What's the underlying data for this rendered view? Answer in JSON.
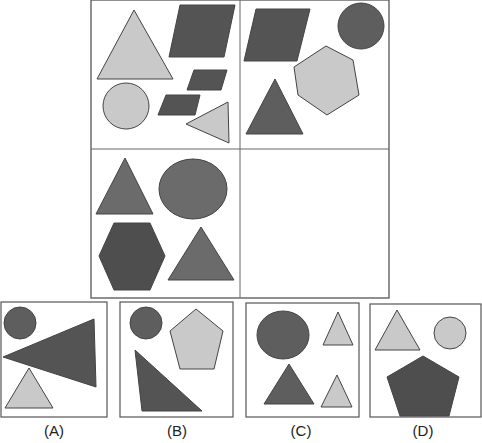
{
  "puzzle": {
    "colors": {
      "dark": "#545454",
      "medium": "#6b6b6b",
      "light": "#c9c9c9",
      "stroke": "#444444",
      "border": "#555555"
    },
    "grid": {
      "cells": [
        {
          "position": "top-left",
          "shapes": [
            "light-triangle",
            "dark-parallelogram",
            "dark-parallelogram",
            "dark-parallelogram",
            "light-circle",
            "light-triangle"
          ]
        },
        {
          "position": "top-right",
          "shapes": [
            "dark-parallelogram",
            "dark-circle",
            "light-hexagon",
            "dark-triangle"
          ]
        },
        {
          "position": "bottom-left",
          "shapes": [
            "dark-triangle",
            "dark-circle",
            "dark-hexagon",
            "dark-triangle"
          ]
        },
        {
          "position": "bottom-right",
          "shapes": []
        }
      ]
    },
    "options": [
      {
        "label": "(A)",
        "shapes": [
          "dark-circle",
          "dark-triangle",
          "light-triangle"
        ]
      },
      {
        "label": "(B)",
        "shapes": [
          "dark-circle",
          "light-pentagon",
          "dark-triangle"
        ]
      },
      {
        "label": "(C)",
        "shapes": [
          "dark-circle",
          "light-triangle",
          "dark-triangle",
          "light-triangle"
        ]
      },
      {
        "label": "(D)",
        "shapes": [
          "light-triangle",
          "light-circle",
          "dark-pentagon"
        ]
      }
    ]
  }
}
